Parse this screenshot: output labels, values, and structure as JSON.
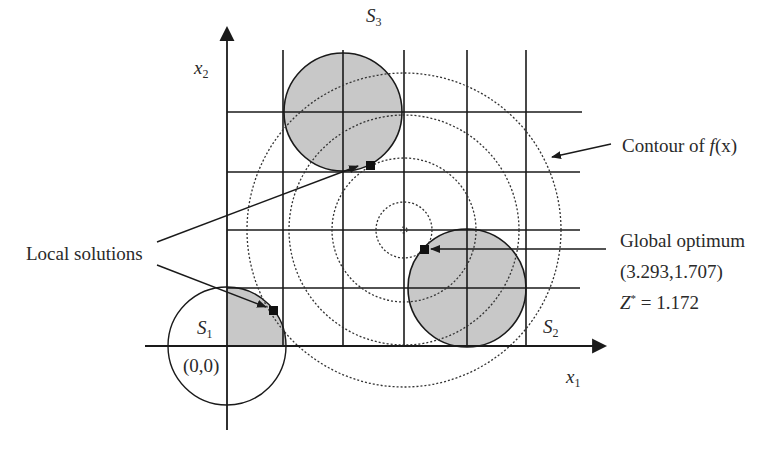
{
  "diagram": {
    "axes": {
      "x_label": "x",
      "x_sub": "1",
      "y_label": "x",
      "y_sub": "2",
      "origin_label": "(0,0)"
    },
    "regions": [
      {
        "name": "S",
        "sub": "1"
      },
      {
        "name": "S",
        "sub": "2"
      },
      {
        "name": "S",
        "sub": "3"
      }
    ],
    "annotations": {
      "contour": {
        "prefix": "Contour of ",
        "func": "f",
        "arg": "(x)"
      },
      "local_solutions": "Local solutions",
      "global_optimum": {
        "title": "Global optimum",
        "point": "(3.293,1.707)",
        "z_label": "Z",
        "z_sup": "*",
        "z_value": " = 1.172"
      }
    },
    "colors": {
      "line": "#1a1a1a",
      "fill": "#c8c8c8",
      "text": "#2a2a2a"
    }
  }
}
